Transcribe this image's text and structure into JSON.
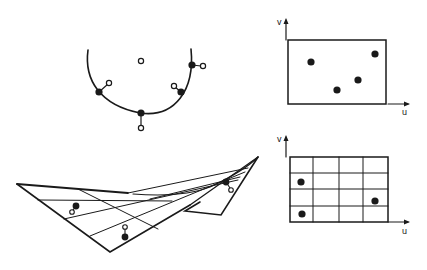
{
  "figure": {
    "ink_color": "#1a1a1a",
    "background_color": "#ffffff"
  },
  "top_left_panel": {
    "name": "arc-with-sample-points",
    "filled_points_on_curve": 4,
    "open_offset_points": 4,
    "center_open_point": 1
  },
  "top_right_panel": {
    "name": "uv-domain-with-points",
    "axis_v_label": "v",
    "axis_u_label": "u",
    "points": 4
  },
  "bottom_left_panel": {
    "name": "twisted-surface-patch",
    "sample_pairs": 3
  },
  "bottom_right_panel": {
    "name": "uv-grid-domain",
    "axis_v_label": "v",
    "axis_u_label": "u",
    "grid_columns": 4,
    "grid_rows": 4,
    "points": 3
  }
}
